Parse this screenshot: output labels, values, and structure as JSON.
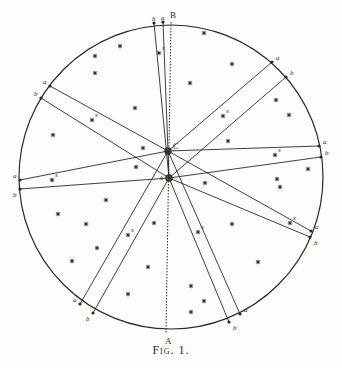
{
  "figure": {
    "caption": "Fig. 1.",
    "circle": {
      "cx": 171,
      "cy": 177,
      "r": 152,
      "color": "#2a2a2a"
    },
    "labels": {
      "top_point": "B",
      "bottom_point": "A",
      "center_upper": "C",
      "center_lower": "b"
    },
    "center_upper": {
      "x": 168,
      "y": 151
    },
    "center_lower": {
      "x": 169,
      "y": 178
    },
    "axis": {
      "x1": 171,
      "y1": 22,
      "x2": 166,
      "y2": 333
    },
    "rays": [
      {
        "name": "top",
        "s": {
          "x": 159,
          "y": 53,
          "label": "s"
        },
        "a": {
          "x": 163,
          "y": 22,
          "label": "a"
        },
        "b": {
          "x": 154,
          "y": 23,
          "label": "b"
        }
      },
      {
        "name": "upper-right",
        "s": {
          "x": 223,
          "y": 116,
          "label": "s"
        },
        "a": {
          "x": 272,
          "y": 62,
          "label": "a"
        },
        "b": {
          "x": 286,
          "y": 77,
          "label": "b"
        }
      },
      {
        "name": "right",
        "s": {
          "x": 275,
          "y": 155,
          "label": "s"
        },
        "a": {
          "x": 319,
          "y": 146,
          "label": "a"
        },
        "b": {
          "x": 321,
          "y": 157,
          "label": "b"
        }
      },
      {
        "name": "lower-right",
        "s": {
          "x": 290,
          "y": 223,
          "label": "s"
        },
        "a": {
          "x": 311,
          "y": 231,
          "label": "a"
        },
        "b": {
          "x": 310,
          "y": 237,
          "label": "b"
        }
      },
      {
        "name": "bottom-right",
        "s": {
          "x": 198,
          "y": 232,
          "label": "s"
        },
        "a": {
          "x": 240,
          "y": 314,
          "label": "a"
        },
        "b": {
          "x": 229,
          "y": 322,
          "label": "b"
        }
      },
      {
        "name": "bottom-left",
        "s": {
          "x": 128,
          "y": 235,
          "label": "s"
        },
        "a": {
          "x": 80,
          "y": 304,
          "label": "a"
        },
        "b": {
          "x": 93,
          "y": 313,
          "label": "b"
        }
      },
      {
        "name": "left",
        "s": {
          "x": 52,
          "y": 180,
          "label": "s"
        },
        "a": {
          "x": 20,
          "y": 180,
          "label": "a"
        },
        "b": {
          "x": 20,
          "y": 189,
          "label": "b"
        }
      },
      {
        "name": "upper-left",
        "s": {
          "x": 92,
          "y": 120,
          "label": "s"
        },
        "a": {
          "x": 50,
          "y": 86,
          "label": "a"
        },
        "b": {
          "x": 41,
          "y": 98,
          "label": "b"
        }
      }
    ],
    "stars": [
      [
        204,
        33
      ],
      [
        232,
        64
      ],
      [
        190,
        83
      ],
      [
        120,
        46
      ],
      [
        95,
        56
      ],
      [
        95,
        73
      ],
      [
        135,
        108
      ],
      [
        53,
        135
      ],
      [
        143,
        148
      ],
      [
        228,
        141
      ],
      [
        276,
        100
      ],
      [
        289,
        115
      ],
      [
        308,
        169
      ],
      [
        277,
        179
      ],
      [
        280,
        187
      ],
      [
        205,
        183
      ],
      [
        136,
        167
      ],
      [
        106,
        200
      ],
      [
        58,
        214
      ],
      [
        86,
        224
      ],
      [
        154,
        223
      ],
      [
        97,
        248
      ],
      [
        72,
        261
      ],
      [
        148,
        267
      ],
      [
        128,
        294
      ],
      [
        232,
        224
      ],
      [
        258,
        262
      ],
      [
        191,
        286
      ],
      [
        204,
        301
      ],
      [
        191,
        312
      ]
    ]
  }
}
